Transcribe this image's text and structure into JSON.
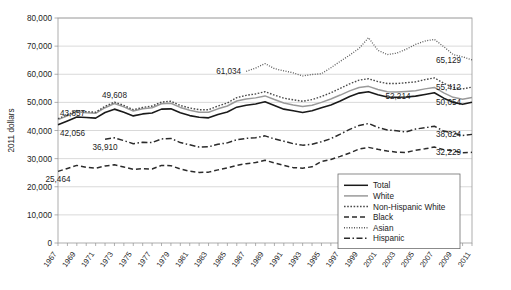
{
  "chart_data": {
    "type": "line",
    "title": "",
    "subtitle": "",
    "xlabel": "",
    "ylabel": "2011 dollars",
    "ylim": [
      0,
      80000
    ],
    "ytick_values": [
      0,
      10000,
      20000,
      30000,
      40000,
      50000,
      60000,
      70000,
      80000
    ],
    "ytick_labels": [
      "0",
      "10,000",
      "20,000",
      "30,000",
      "40,000",
      "50,000",
      "60,000",
      "70,000",
      "80,000"
    ],
    "grid": true,
    "legend_position": "bottom-right",
    "x": [
      1967,
      1968,
      1969,
      1970,
      1971,
      1972,
      1973,
      1974,
      1975,
      1976,
      1977,
      1978,
      1979,
      1980,
      1981,
      1982,
      1983,
      1984,
      1985,
      1986,
      1987,
      1988,
      1989,
      1990,
      1991,
      1992,
      1993,
      1994,
      1995,
      1996,
      1997,
      1998,
      1999,
      2000,
      2001,
      2002,
      2003,
      2004,
      2005,
      2006,
      2007,
      2008,
      2009,
      2010,
      2011
    ],
    "xtick_labels": [
      "1967",
      "1969",
      "1971",
      "1973",
      "1975",
      "1977",
      "1979",
      "1981",
      "1983",
      "1985",
      "1987",
      "1989",
      "1991",
      "1993",
      "1995",
      "1997",
      "1999",
      "2001",
      "2003",
      "2005",
      "2007",
      "2009",
      "2011"
    ],
    "series": [
      {
        "name": "Total",
        "style": "solid",
        "color": "#1a1a1a",
        "width": 1.6,
        "values": [
          42056,
          43400,
          44800,
          44600,
          44400,
          46400,
          47600,
          46500,
          45200,
          45900,
          46200,
          47600,
          47700,
          46300,
          45300,
          44700,
          44500,
          45700,
          46600,
          48300,
          49000,
          49400,
          50200,
          48900,
          47600,
          47000,
          46400,
          47000,
          48100,
          49100,
          50500,
          52100,
          53300,
          53800,
          52700,
          51900,
          51800,
          51900,
          52214,
          52800,
          53400,
          51500,
          50000,
          49300,
          50054
        ]
      },
      {
        "name": "White",
        "style": "solid",
        "color": "#9a9a9a",
        "width": 1.5,
        "values": [
          43857,
          45200,
          46700,
          46300,
          46100,
          48100,
          49608,
          48400,
          46900,
          47700,
          48100,
          49500,
          49700,
          48200,
          47200,
          46500,
          46500,
          47700,
          48700,
          50500,
          51200,
          51600,
          52300,
          51000,
          49800,
          49100,
          48500,
          49000,
          50000,
          51200,
          52600,
          54100,
          55300,
          55700,
          54600,
          53800,
          53700,
          53900,
          54100,
          54800,
          55300,
          53400,
          51800,
          51100,
          51700
        ]
      },
      {
        "name": "Non-Hispanic White",
        "style": "dotted",
        "color": "#4a4a4a",
        "width": 1.4,
        "values": [
          44200,
          45600,
          47100,
          46700,
          46500,
          48600,
          50100,
          48900,
          47400,
          48200,
          48700,
          50100,
          50400,
          48900,
          48000,
          47400,
          47400,
          48700,
          49800,
          51700,
          52500,
          53000,
          53800,
          52600,
          51500,
          50900,
          50400,
          51000,
          52100,
          53400,
          55000,
          56600,
          57900,
          58400,
          57400,
          56700,
          56700,
          57000,
          57300,
          58100,
          58700,
          56800,
          55300,
          54800,
          55412
        ]
      },
      {
        "name": "Black",
        "style": "dashed",
        "color": "#2b2b2b",
        "width": 1.5,
        "values": [
          25464,
          26500,
          27600,
          26900,
          26600,
          27400,
          27800,
          27000,
          26200,
          26400,
          26300,
          27600,
          27500,
          26300,
          25500,
          25100,
          25200,
          26000,
          26700,
          27600,
          28200,
          28600,
          29400,
          28500,
          27600,
          26800,
          26600,
          27100,
          29000,
          29700,
          30800,
          32000,
          33400,
          34000,
          33300,
          32700,
          32300,
          32200,
          33000,
          33500,
          34100,
          33200,
          32700,
          32100,
          32229
        ]
      },
      {
        "name": "Asian",
        "style": "fine-dotted",
        "color": "#5a5a5a",
        "width": 1.3,
        "values": [
          null,
          null,
          null,
          null,
          null,
          null,
          null,
          null,
          null,
          null,
          null,
          null,
          null,
          null,
          null,
          null,
          null,
          null,
          null,
          null,
          61034,
          62200,
          63800,
          62000,
          61200,
          60500,
          59400,
          59900,
          60200,
          62300,
          64600,
          66800,
          69200,
          73000,
          68500,
          67000,
          67500,
          68900,
          70600,
          71800,
          72400,
          69800,
          67000,
          66200,
          65129
        ]
      },
      {
        "name": "Hispanic",
        "style": "dash-dot",
        "color": "#2b2b2b",
        "width": 1.5,
        "values": [
          null,
          null,
          null,
          null,
          null,
          36910,
          37400,
          36400,
          35300,
          35800,
          35700,
          37000,
          37200,
          35700,
          34900,
          34100,
          34200,
          35100,
          35600,
          36700,
          37200,
          37400,
          38100,
          37000,
          36200,
          35300,
          34800,
          35100,
          36000,
          37100,
          38700,
          40400,
          41800,
          42500,
          41100,
          40200,
          39900,
          39500,
          40500,
          41000,
          41500,
          39800,
          39100,
          38200,
          38624
        ]
      }
    ],
    "point_labels": [
      {
        "text": "43,857",
        "series": "White",
        "x": 1967,
        "anchor": "left-above"
      },
      {
        "text": "42,056",
        "series": "Total",
        "x": 1967,
        "anchor": "left-below"
      },
      {
        "text": "49,608",
        "series": "White",
        "x": 1973,
        "anchor": "above"
      },
      {
        "text": "36,910",
        "series": "Hispanic",
        "x": 1972,
        "anchor": "below"
      },
      {
        "text": "25,464",
        "series": "Black",
        "x": 1967,
        "anchor": "below"
      },
      {
        "text": "61,034",
        "series": "Asian",
        "x": 1987,
        "anchor": "left"
      },
      {
        "text": "65,129",
        "series": "Asian",
        "x": 2011,
        "anchor": "right"
      },
      {
        "text": "55,412",
        "series": "Non-Hispanic White",
        "x": 2011,
        "anchor": "right"
      },
      {
        "text": "52,214",
        "series": "Total",
        "x": 2005,
        "anchor": "left"
      },
      {
        "text": "50,054",
        "series": "Total",
        "x": 2011,
        "anchor": "right"
      },
      {
        "text": "38,624",
        "series": "Hispanic",
        "x": 2011,
        "anchor": "right"
      },
      {
        "text": "32,229",
        "series": "Black",
        "x": 2011,
        "anchor": "right"
      }
    ],
    "legend_entries": [
      {
        "label": "Total",
        "style": "solid",
        "color": "#1a1a1a"
      },
      {
        "label": "White",
        "style": "solid",
        "color": "#9a9a9a"
      },
      {
        "label": "Non-Hispanic White",
        "style": "dotted",
        "color": "#4a4a4a"
      },
      {
        "label": "Black",
        "style": "dashed",
        "color": "#2b2b2b"
      },
      {
        "label": "Asian",
        "style": "fine-dotted",
        "color": "#5a5a5a"
      },
      {
        "label": "Hispanic",
        "style": "dash-dot",
        "color": "#2b2b2b"
      }
    ]
  }
}
